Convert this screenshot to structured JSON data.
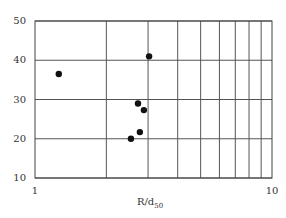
{
  "chart_data": {
    "type": "scatter",
    "title": "",
    "xlabel": "R/d",
    "xlabel_subscript": "50",
    "ylabel": "",
    "xscale": "log",
    "xlim": [
      1,
      10
    ],
    "ylim": [
      10,
      50
    ],
    "grid": true,
    "x_ticks": [
      "1",
      "10"
    ],
    "y_ticks": [
      "10",
      "20",
      "30",
      "40",
      "50"
    ],
    "series": [
      {
        "name": "data",
        "marker": "filled-circle",
        "color": "#111111",
        "points": [
          {
            "x": 1.26,
            "y": 36.5
          },
          {
            "x": 3.03,
            "y": 41.0
          },
          {
            "x": 2.72,
            "y": 29.0
          },
          {
            "x": 2.88,
            "y": 27.3
          },
          {
            "x": 2.77,
            "y": 21.7
          },
          {
            "x": 2.54,
            "y": 20.0
          }
        ]
      }
    ]
  }
}
